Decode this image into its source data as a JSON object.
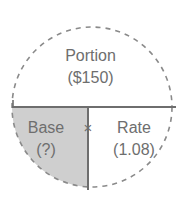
{
  "diagram": {
    "type": "percentage-relationship-circle",
    "background_color": "#ffffff",
    "circle": {
      "outline_style": "dashed",
      "outline_color": "#8a8a8a",
      "center_x": 92,
      "center_y": 107,
      "radius": 80
    },
    "divider_color": "#6e6e6e",
    "text_color": "#6e6e6e",
    "shaded_fill": "#cfcfcf",
    "unshaded_fill": "#ffffff",
    "regions": [
      {
        "id": "portion",
        "position": "top-half",
        "label": "Portion",
        "value": "($150)",
        "shaded": false,
        "fill": "#ffffff"
      },
      {
        "id": "base",
        "position": "bottom-left-quadrant",
        "label": "Base",
        "value": "(?)",
        "shaded": true,
        "fill": "#cfcfcf"
      },
      {
        "id": "rate",
        "position": "bottom-right-quadrant",
        "label": "Rate",
        "value": "(1.08)",
        "shaded": false,
        "fill": "#ffffff"
      }
    ],
    "operator": {
      "id": "multiply",
      "symbol": "×",
      "between": [
        "base",
        "rate"
      ]
    }
  }
}
